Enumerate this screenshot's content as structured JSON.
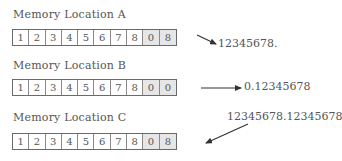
{
  "locations": [
    {
      "label": "Memory Location A",
      "digits": [
        "1",
        "2",
        "3",
        "4",
        "5",
        "6",
        "7",
        "8",
        "0",
        "8"
      ],
      "shaded": [
        false,
        false,
        false,
        false,
        false,
        false,
        false,
        false,
        true,
        true
      ],
      "value": "12345678."
    },
    {
      "label": "Memory Location B",
      "digits": [
        "1",
        "2",
        "3",
        "4",
        "5",
        "6",
        "7",
        "8",
        "0",
        "0"
      ],
      "shaded": [
        false,
        false,
        false,
        false,
        false,
        false,
        false,
        false,
        true,
        true
      ],
      "value": "0.12345678"
    },
    {
      "label": "Memory Location C",
      "digits": [
        "1",
        "2",
        "3",
        "4",
        "5",
        "6",
        "7",
        "8",
        "0",
        "8"
      ],
      "shaded": [
        false,
        false,
        false,
        false,
        false,
        false,
        false,
        false,
        true,
        true
      ],
      "value": "12345678.12345678"
    }
  ],
  "arrow_icon": "arrow-right-icon"
}
